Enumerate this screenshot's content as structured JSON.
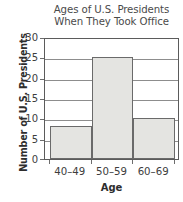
{
  "chart_data": {
    "type": "bar",
    "title": "Ages of U.S. Presidents When They Took Office",
    "title_lines": [
      "Ages of U.S. Presidents",
      "When They Took Office"
    ],
    "xlabel": "Age",
    "ylabel": "Number of U.S. Presidents",
    "categories": [
      "40–49",
      "50–59",
      "60–69"
    ],
    "values": [
      8,
      25,
      10
    ],
    "ylim": [
      0,
      30
    ],
    "ytick_values": [
      0,
      5,
      10,
      15,
      20,
      25,
      30
    ],
    "ytick_labels": [
      "0",
      "5",
      "10",
      "15",
      "20",
      "25",
      "30"
    ],
    "grid": true,
    "legend": false,
    "bar_style": "histogram-adjacent",
    "colors": {
      "bar_fill": "#e4e4e1",
      "bar_outline": "#6a6a6a",
      "gridline": "#8d8d8d",
      "frame": "#5b5b5b",
      "text": "#3d3d3d",
      "background": "#ffffff"
    }
  }
}
